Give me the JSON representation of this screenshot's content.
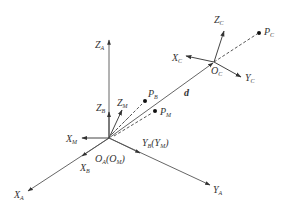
{
  "diagram": {
    "type": "coordinate-frames",
    "colors": {
      "line": "#444444",
      "text": "#333333",
      "background": "#ffffff"
    },
    "frames": {
      "A": {
        "origin_label": "O",
        "origin_sub": "A",
        "origin_alt": "(O",
        "origin_alt_sub": "M",
        "origin_alt_close": ")"
      },
      "C": {
        "origin_label": "O",
        "origin_sub": "C"
      }
    },
    "labels": {
      "ZA": {
        "main": "Z",
        "sub": "A"
      },
      "XA": {
        "main": "X",
        "sub": "A"
      },
      "YA": {
        "main": "Y",
        "sub": "A"
      },
      "ZB": {
        "main": "Z",
        "sub": "B"
      },
      "ZM": {
        "main": "Z",
        "sub": "M"
      },
      "XM": {
        "main": "X",
        "sub": "M"
      },
      "XB": {
        "main": "X",
        "sub": "B"
      },
      "YB": {
        "main": "Y",
        "sub": "B",
        "alt_open": "(Y",
        "alt_sub": "M",
        "alt_close": ")"
      },
      "ZC": {
        "main": "Z",
        "sub": "C"
      },
      "XC": {
        "main": "X",
        "sub": "C"
      },
      "YC": {
        "main": "Y",
        "sub": "C"
      },
      "PB": {
        "main": "P",
        "sub": "B"
      },
      "PM": {
        "main": "P",
        "sub": "M"
      },
      "PC": {
        "main": "P",
        "sub": "C"
      },
      "d": {
        "main": "d"
      }
    }
  }
}
